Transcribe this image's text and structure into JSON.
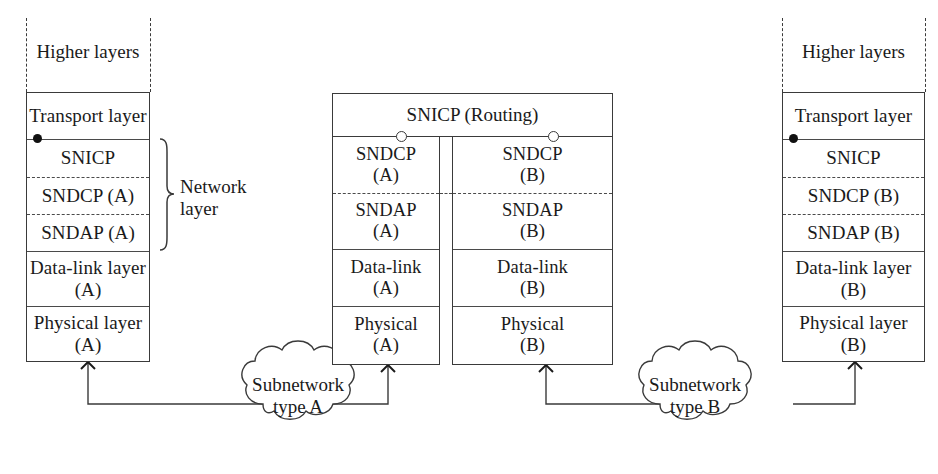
{
  "diagram": {
    "width": 938,
    "height": 474,
    "line_color": "#3a3a3a",
    "background": "#ffffff"
  },
  "left_stack": {
    "name": "End system A",
    "higher_layers_label": "Higher layers",
    "layers": [
      {
        "label": "Transport layer",
        "border": "solid"
      },
      {
        "label": "SNICP",
        "border": "solid"
      },
      {
        "label": "SNDCP (A)",
        "border": "dashed"
      },
      {
        "label": "SNDAP (A)",
        "border": "dashed"
      },
      {
        "label": "Data-link layer\n(A)",
        "border": "solid"
      },
      {
        "label": "Physical layer\n(A)",
        "border": "solid"
      }
    ],
    "brace_label": "Network\nlayer",
    "sap_marker": "filled-dot"
  },
  "center_stack": {
    "name": "Intermediate system (router)",
    "header_label": "SNICP (Routing)",
    "sap_markers": [
      "open-circle",
      "open-circle"
    ],
    "column_a": {
      "layers": [
        {
          "label": "SNDCP\n(A)",
          "border": "solid"
        },
        {
          "label": "SNDAP\n(A)",
          "border": "dashed"
        },
        {
          "label": "Data-link\n(A)",
          "border": "solid"
        },
        {
          "label": "Physical\n(A)",
          "border": "solid"
        }
      ]
    },
    "column_b": {
      "layers": [
        {
          "label": "SNDCP\n(B)",
          "border": "solid"
        },
        {
          "label": "SNDAP\n(B)",
          "border": "dashed"
        },
        {
          "label": "Data-link\n(B)",
          "border": "solid"
        },
        {
          "label": "Physical\n(B)",
          "border": "solid"
        }
      ]
    }
  },
  "right_stack": {
    "name": "End system B",
    "higher_layers_label": "Higher layers",
    "layers": [
      {
        "label": "Transport layer",
        "border": "solid"
      },
      {
        "label": "SNICP",
        "border": "solid"
      },
      {
        "label": "SNDCP (B)",
        "border": "dashed"
      },
      {
        "label": "SNDAP (B)",
        "border": "dashed"
      },
      {
        "label": "Data-link layer\n(B)",
        "border": "solid"
      },
      {
        "label": "Physical layer\n(B)",
        "border": "solid"
      }
    ],
    "sap_marker": "filled-dot"
  },
  "clouds": [
    {
      "label": "Subnetwork\ntype A",
      "line1": "Subnetwork",
      "line2": "type A"
    },
    {
      "label": "Subnetwork\ntype B",
      "line1": "Subnetwork",
      "line2": "type B"
    }
  ],
  "connectors": {
    "marker": "x-cross",
    "count": 4
  }
}
